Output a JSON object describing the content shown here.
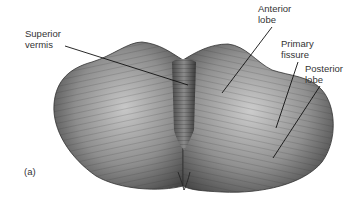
{
  "figure": {
    "panel_label": "(a)",
    "labels": [
      {
        "id": "superior-vermis",
        "text": "Superior\nvermis"
      },
      {
        "id": "anterior-lobe",
        "text": "Anterior\nlobe"
      },
      {
        "id": "primary-fissure",
        "text": "Primary\nfissure"
      },
      {
        "id": "posterior-lobe",
        "text": "Posterior\nlobe"
      }
    ],
    "colors": {
      "background": "#ffffff",
      "tissue_dark": "#3a3a3a",
      "tissue_mid": "#7a7a7a",
      "tissue_light": "#c4c4c4",
      "leader_line": "#111111",
      "text": "#333333"
    }
  }
}
